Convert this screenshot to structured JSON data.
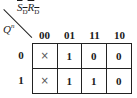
{
  "kmap": {
    "col_variable": {
      "s": "S",
      "s_sub": "D",
      "r": "R",
      "r_sub": "D"
    },
    "row_variable": {
      "base": "Q",
      "sup": "n"
    },
    "col_headers": [
      "00",
      "01",
      "11",
      "10"
    ],
    "row_headers": [
      "0",
      "1"
    ],
    "cells": [
      [
        "×",
        "1",
        "0",
        "0"
      ],
      [
        "×",
        "1",
        "1",
        "0"
      ]
    ]
  }
}
